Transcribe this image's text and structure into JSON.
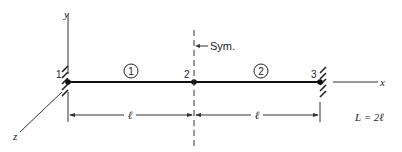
{
  "diagram": {
    "type": "beam-structure",
    "axes": {
      "x": "x",
      "y": "y",
      "z": "z"
    },
    "nodes": [
      {
        "id": "1",
        "label": "1",
        "support": "fixed"
      },
      {
        "id": "2",
        "label": "2",
        "support": "none"
      },
      {
        "id": "3",
        "label": "3",
        "support": "fixed"
      }
    ],
    "elements": [
      {
        "label": "1",
        "from": "1",
        "to": "2"
      },
      {
        "label": "2",
        "from": "2",
        "to": "3"
      }
    ],
    "symmetry_label": "Sym.",
    "dimensions": [
      {
        "label": "ℓ",
        "from": "1",
        "to": "2"
      },
      {
        "label": "ℓ",
        "from": "2",
        "to": "3"
      }
    ],
    "total_length_label": "L = 2ℓ",
    "colors": {
      "line": "#222222",
      "background": "#ffffff"
    }
  }
}
